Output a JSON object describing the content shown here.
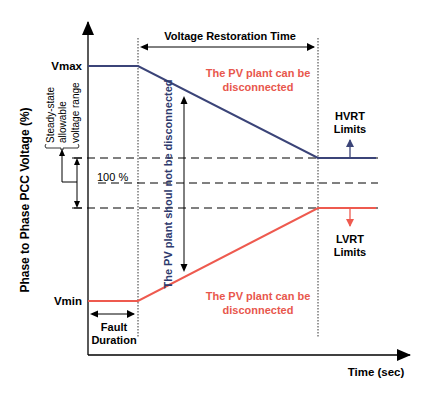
{
  "diagram": {
    "type": "voltage-ride-through-limits",
    "y_axis_label": "Phase to Phase PCC Voltage  (%)",
    "x_axis_label": "Time (sec)",
    "vmax_label": "Vmax",
    "vmin_label": "Vmin",
    "nominal_label": "100 %",
    "steady_state_label_line1": "Steady-state",
    "steady_state_label_line2": "allowable",
    "steady_state_label_line3": "voltage range",
    "restoration_label": "Voltage Restoration Time",
    "fault_label_line1": "Fault",
    "fault_label_line2": "Duration",
    "upper_region_line1": "The PV plant can be",
    "upper_region_line2": "disconnected",
    "lower_region_line1": "The PV plant can be",
    "lower_region_line2": "disconnected",
    "middle_region": "The PV plant shoul not be disconnected",
    "hvrt_line1": "HVRT",
    "hvrt_line2": "Limits",
    "lvrt_line1": "LVRT",
    "lvrt_line2": "Limits",
    "colors": {
      "hvrt": "#3b4478",
      "lvrt": "#ee5a4f",
      "red_text": "#e8574d",
      "blue_text": "#2e3a6e",
      "axis": "#000000"
    }
  }
}
